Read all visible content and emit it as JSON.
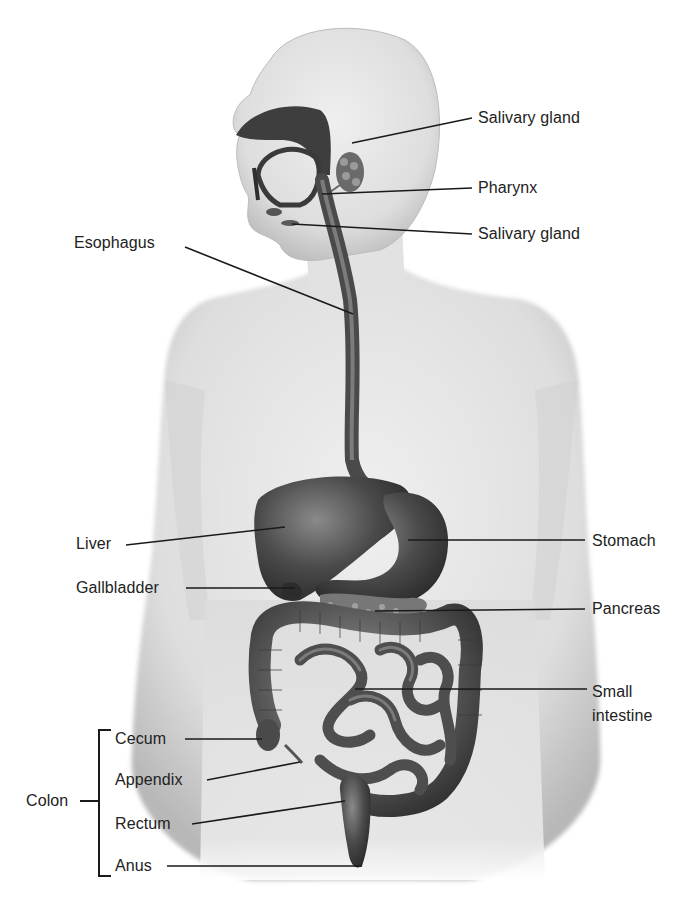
{
  "figure": {
    "colors": {
      "background": "#ffffff",
      "skin": "#e4e4e4",
      "skin_shadow": "#bdbdbd",
      "organ_dark": "#3a3a3a",
      "organ_mid": "#5c5c5c",
      "leader_line": "#1a1a1a",
      "text": "#222222"
    }
  },
  "labels": {
    "salivary_gland_top": "Salivary gland",
    "pharynx": "Pharynx",
    "salivary_gland_bottom": "Salivary gland",
    "esophagus": "Esophagus",
    "liver": "Liver",
    "gallbladder": "Gallbladder",
    "stomach": "Stomach",
    "pancreas": "Pancreas",
    "small_intestine_line1": "Small",
    "small_intestine_line2": "intestine",
    "colon": "Colon",
    "cecum": "Cecum",
    "appendix": "Appendix",
    "rectum": "Rectum",
    "anus": "Anus"
  }
}
